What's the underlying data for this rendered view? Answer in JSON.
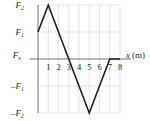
{
  "chart_data": {
    "type": "line",
    "title": "",
    "xlabel": "x (m)",
    "ylabel": "F_x",
    "xlim": [
      0,
      8
    ],
    "ylim": [
      -2,
      2
    ],
    "grid": true,
    "legend": false,
    "xticks": [
      {
        "value": 1,
        "label": "1"
      },
      {
        "value": 2,
        "label": "2"
      },
      {
        "value": 3,
        "label": "3"
      },
      {
        "value": 4,
        "label": "4"
      },
      {
        "value": 5,
        "label": "5"
      },
      {
        "value": 6,
        "label": "6"
      },
      {
        "value": 7,
        "label": "7"
      },
      {
        "value": 8,
        "label": "8"
      }
    ],
    "yticks": [
      {
        "value": 2,
        "label": "F",
        "sub": "2",
        "sign": ""
      },
      {
        "value": 1,
        "label": "F",
        "sub": "1",
        "sign": ""
      },
      {
        "value": 0,
        "label": "F",
        "sub": "x",
        "sign": ""
      },
      {
        "value": -1,
        "label": "F",
        "sub": "1",
        "sign": "–"
      },
      {
        "value": -2,
        "label": "F",
        "sub": "2",
        "sign": "–"
      }
    ],
    "series": [
      {
        "name": "Fx(x)",
        "color": "#231f20",
        "points": [
          {
            "x": 0,
            "y": 1
          },
          {
            "x": 1,
            "y": 2
          },
          {
            "x": 5,
            "y": -2
          },
          {
            "x": 7,
            "y": 0
          },
          {
            "x": 8,
            "y": 0
          }
        ]
      }
    ],
    "annotations": []
  },
  "axis_labels": {
    "x_axis_name": "x",
    "x_axis_unit": "(m)",
    "y_axis_base": "F",
    "y_axis_sub": "x"
  },
  "colors": {
    "curve": "#231f20",
    "axis": "#6d6e71",
    "grid": "#d9dade",
    "text": "#231f20",
    "background": "#ffffff"
  }
}
